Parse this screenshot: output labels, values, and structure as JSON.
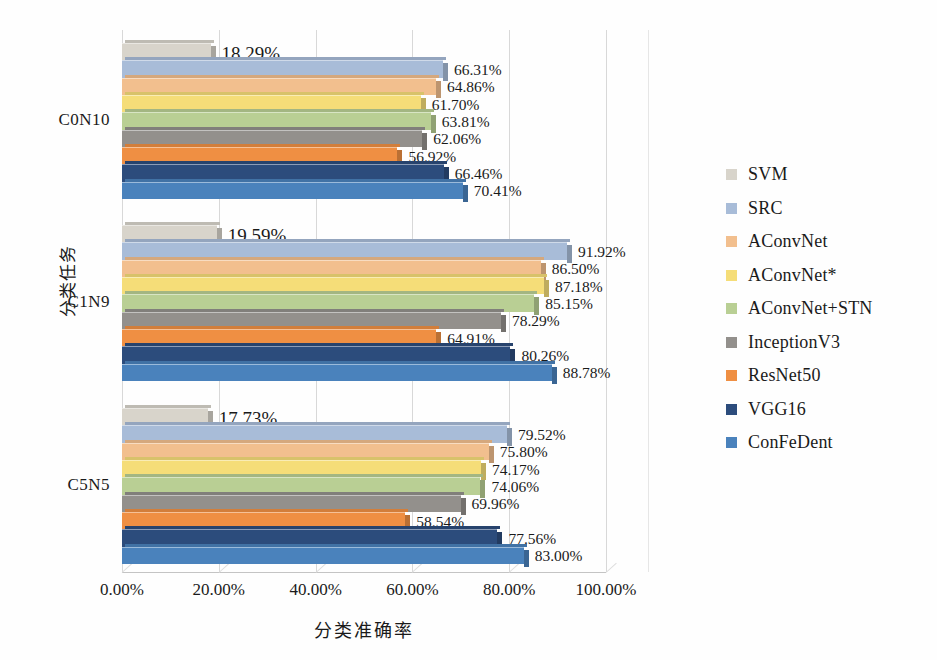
{
  "chart_data": {
    "type": "bar",
    "orientation": "horizontal",
    "title": "",
    "xlabel": "分类准确率",
    "ylabel": "分类任务",
    "categories": [
      "C0N10",
      "C1N9",
      "C5N5"
    ],
    "xlim": [
      0,
      100
    ],
    "xticks": [
      "0.00%",
      "20.00%",
      "40.00%",
      "60.00%",
      "80.00%",
      "100.00%"
    ],
    "xtick_values": [
      0,
      20,
      40,
      60,
      80,
      100
    ],
    "grid": true,
    "legend_position": "right",
    "series": [
      {
        "name": "SVM",
        "color": "#d8d4cb",
        "values": [
          18.29,
          19.59,
          17.73
        ],
        "labels": [
          "18.29%",
          "19.59%",
          "17.73%"
        ]
      },
      {
        "name": "SRC",
        "color": "#a8bcd8",
        "values": [
          66.31,
          91.92,
          79.52
        ],
        "labels": [
          "66.31%",
          "91.92%",
          "79.52%"
        ]
      },
      {
        "name": "AConvNet",
        "color": "#f2bf8e",
        "values": [
          64.86,
          86.5,
          75.8
        ],
        "labels": [
          "64.86%",
          "86.50%",
          "75.80%"
        ]
      },
      {
        "name": "AConvNet*",
        "color": "#f5dd78",
        "values": [
          61.7,
          87.18,
          74.17
        ],
        "labels": [
          "61.70%",
          "87.18%",
          "74.17%"
        ]
      },
      {
        "name": "AConvNet+STN",
        "color": "#b9cf94",
        "values": [
          63.81,
          85.15,
          74.06
        ],
        "labels": [
          "63.81%",
          "85.15%",
          "74.06%"
        ]
      },
      {
        "name": "InceptionV3",
        "color": "#93908c",
        "values": [
          62.06,
          78.29,
          69.96
        ],
        "labels": [
          "62.06%",
          "78.29%",
          "69.96%"
        ]
      },
      {
        "name": "ResNet50",
        "color": "#ef8f43",
        "values": [
          56.92,
          64.91,
          58.54
        ],
        "labels": [
          "56.92%",
          "64.91%",
          "58.54%"
        ]
      },
      {
        "name": "VGG16",
        "color": "#2c4c7c",
        "values": [
          66.46,
          80.26,
          77.56
        ],
        "labels": [
          "66.46%",
          "80.26%",
          "77.56%"
        ]
      },
      {
        "name": "ConFeDent",
        "color": "#4a82bc",
        "values": [
          70.41,
          88.78,
          83.0
        ],
        "labels": [
          "70.41%",
          "88.78%",
          "83.00%"
        ]
      }
    ]
  }
}
